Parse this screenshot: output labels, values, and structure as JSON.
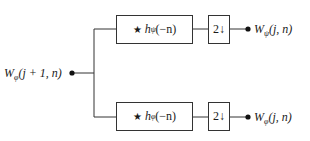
{
  "diagram": {
    "title": "",
    "input": {
      "prefix": "W",
      "sub": "φ",
      "args": "(j + 1, n)"
    },
    "branches": [
      {
        "filter": {
          "star": "★",
          "h": "h",
          "sub": "ψ",
          "args": "(−n)"
        },
        "downsampler": "2↓",
        "output": {
          "prefix": "W",
          "sub": "ψ",
          "args": "(j, n)"
        }
      },
      {
        "filter": {
          "star": "★",
          "h": "h",
          "sub": "φ",
          "args": "(−n)"
        },
        "downsampler": "2↓",
        "output": {
          "prefix": "W",
          "sub": "φ",
          "args": "(j, n)"
        }
      }
    ],
    "colors": {
      "line": "#333333",
      "text": "#1a1a1a",
      "background": "#ffffff"
    }
  }
}
